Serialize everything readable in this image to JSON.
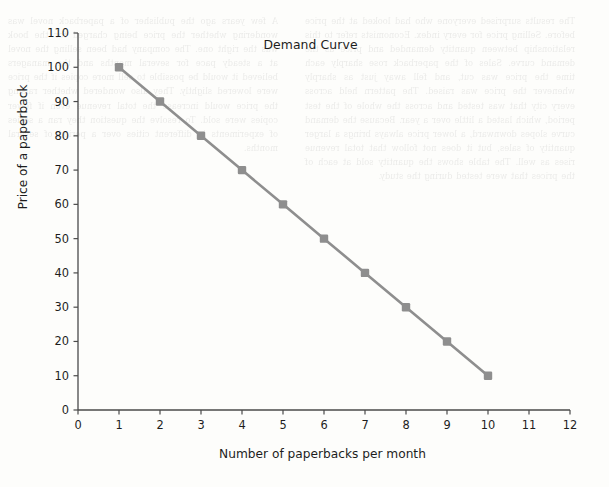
{
  "page": {
    "background_color": "#fdfdfb",
    "bleed_text_color": "#2b2b2b",
    "bleed_left": "A few years ago the publisher of a paperback novel was wondering whether the price being charged for the book was the right one. The company had been selling the novel at a steady pace for several months and the managers believed it would be possible to sell more copies if the price were lowered slightly. They also wondered whether raising the price would increase the total revenue even if fewer copies were sold. To resolve the question they ran a series of experiments in different cities over a period of several months.",
    "bleed_right": "The results surprised everyone who had looked at the price before. Selling price for every index. Economists refer to this relationship between quantity demanded and price as the demand curve. Sales of the paperback rose sharply each time the price was cut, and fell away just as sharply whenever the price was raised. The pattern held across every city that was tested and across the whole of the test period, which lasted a little over a year. Because the demand curve slopes downward, a lower price always brings a larger quantity of sales, but it does not follow that total revenue rises as well. The table shows the quantity sold at each of the prices that were tested during the study."
  },
  "chart_data": {
    "type": "line",
    "title": "Demand Curve",
    "xlabel": "Number of paperbacks per month",
    "ylabel": "Price of a paperback",
    "x": [
      1,
      2,
      3,
      4,
      5,
      6,
      7,
      8,
      9,
      10
    ],
    "values": [
      100,
      90,
      80,
      70,
      60,
      50,
      40,
      30,
      20,
      10
    ],
    "series_name": "Demand",
    "xlim": [
      0,
      12
    ],
    "ylim": [
      0,
      110
    ],
    "xticks": [
      0,
      1,
      2,
      3,
      4,
      5,
      6,
      7,
      8,
      9,
      10,
      11,
      12
    ],
    "yticks": [
      0,
      10,
      20,
      30,
      40,
      50,
      60,
      70,
      80,
      90,
      100,
      110
    ],
    "grid": false,
    "legend": "none",
    "line_color": "#8e8e8e",
    "marker_color": "#8e8e8e",
    "marker_shape": "square",
    "axis_color": "#4a4a4a",
    "text_color": "#1d1d1d"
  }
}
